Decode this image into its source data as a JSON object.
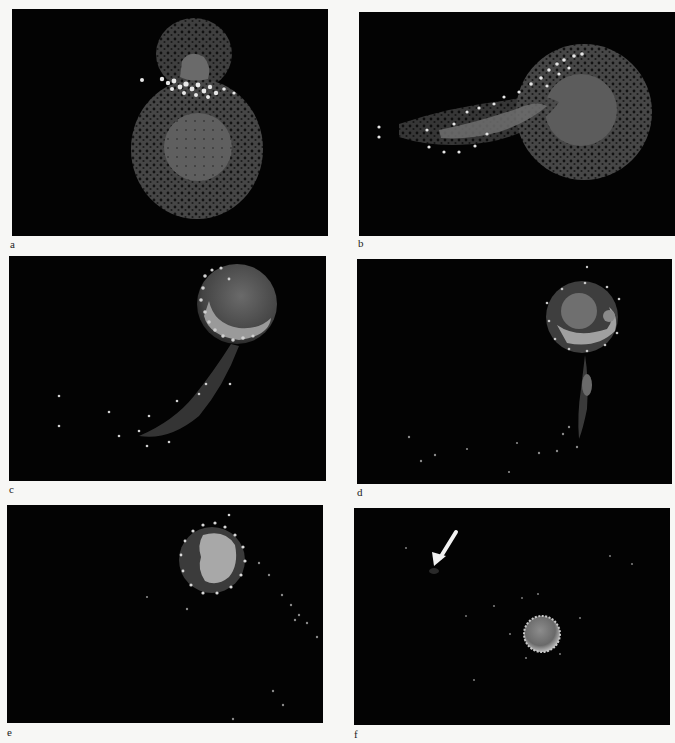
{
  "figure": {
    "panels": [
      {
        "id": "a",
        "label": "a",
        "rect": {
          "x": 12,
          "y": 9,
          "w": 316,
          "h": 227
        },
        "label_pos": {
          "x": 10,
          "y": 239
        },
        "description": "Two particle clouds in contact: small blob at top with bright white band at interface over large spherical body"
      },
      {
        "id": "b",
        "label": "b",
        "rect": {
          "x": 359,
          "y": 12,
          "w": 316,
          "h": 224
        },
        "label_pos": {
          "x": 358,
          "y": 238
        },
        "description": "Large body at right with elongated tail of debris extending left, bright particles along upper edge"
      },
      {
        "id": "c",
        "label": "c",
        "rect": {
          "x": 9,
          "y": 256,
          "w": 317,
          "h": 225
        },
        "label_pos": {
          "x": 9,
          "y": 484
        },
        "description": "Compact body at upper right with bright crescent, curved debris tail sweeping down-left"
      },
      {
        "id": "d",
        "label": "d",
        "rect": {
          "x": 357,
          "y": 259,
          "w": 315,
          "h": 225
        },
        "label_pos": {
          "x": 357,
          "y": 487
        },
        "description": "Round body upper right with bright ring, thin vertical debris stream below with small clump"
      },
      {
        "id": "e",
        "label": "e",
        "rect": {
          "x": 7,
          "y": 505,
          "w": 316,
          "h": 218
        },
        "label_pos": {
          "x": 7,
          "y": 727
        },
        "description": "Body with bright light-gray core region and dark halo, sparse debris trailing to right"
      },
      {
        "id": "f",
        "label": "f",
        "rect": {
          "x": 354,
          "y": 508,
          "w": 316,
          "h": 217
        },
        "label_pos": {
          "x": 354,
          "y": 729
        },
        "description": "Small compact bright sphere at lower center; white arrow at upper left pointing to faint small clump",
        "arrow": {
          "color": "#f2f2f2",
          "pointing_at": "faint clump"
        }
      }
    ],
    "colors": {
      "background": "#030303",
      "page": "#f7f7f5",
      "dim_particle": "#4a4a4a",
      "mid_particle": "#6e6e6e",
      "core": "#5e5e5e",
      "bright_particle": "#e6e6e6",
      "label": "#222222"
    }
  }
}
